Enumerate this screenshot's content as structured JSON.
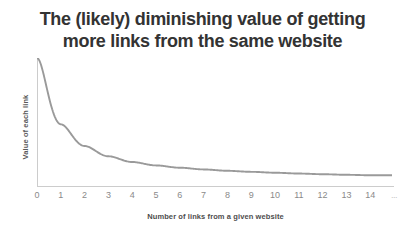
{
  "chart_data": {
    "type": "line",
    "title": "The (likely) diminishing value of getting more links from the same website",
    "title_lines": [
      "The (likely) diminishing value of getting",
      "more links from the same website"
    ],
    "xlabel": "Number of links from a given website",
    "ylabel": "Value of each link",
    "grid": false,
    "legend": "none",
    "xlim": [
      0,
      14.9
    ],
    "ylim": [
      0,
      1.12
    ],
    "x_tick_labels": [
      "0",
      "1",
      "2",
      "3",
      "4",
      "5",
      "6",
      "7",
      "8",
      "9",
      "10",
      "11",
      "12",
      "13",
      "14",
      "..."
    ],
    "x": [
      0,
      1,
      2,
      3,
      4,
      5,
      6,
      7,
      8,
      9,
      10,
      11,
      12,
      13,
      14
    ],
    "y": [
      1.12,
      0.54,
      0.35,
      0.26,
      0.21,
      0.18,
      0.16,
      0.145,
      0.133,
      0.124,
      0.116,
      0.109,
      0.103,
      0.098,
      0.094
    ],
    "series": [
      {
        "name": "Value of each link",
        "values": [
          1.12,
          0.54,
          0.35,
          0.26,
          0.21,
          0.18,
          0.16,
          0.145,
          0.133,
          0.124,
          0.116,
          0.109,
          0.103,
          0.098,
          0.094
        ]
      }
    ],
    "colors": {
      "curve": "#9a9a9a",
      "axis": "#cccccc",
      "title_text": "#333333",
      "tick_text": "#8a8a8a",
      "axis_label_text": "#4d4d4d",
      "background": "#ffffff"
    }
  }
}
